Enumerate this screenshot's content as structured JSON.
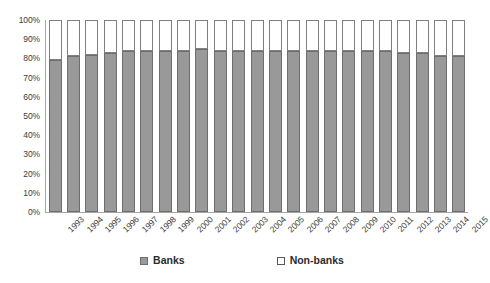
{
  "chart_data": {
    "type": "bar",
    "stacked": true,
    "stacked_mode": "percent",
    "title": "",
    "subtitle": "",
    "xlabel": "",
    "ylabel": "",
    "ylim": [
      0,
      100
    ],
    "ytick_labels": [
      "100%",
      "90%",
      "80%",
      "70%",
      "60%",
      "50%",
      "40%",
      "30%",
      "20%",
      "10%",
      "0%"
    ],
    "ytick_values": [
      100,
      90,
      80,
      70,
      60,
      50,
      40,
      30,
      20,
      10,
      0
    ],
    "grid": false,
    "legend_position": "bottom",
    "categories": [
      "1993",
      "1994",
      "1995",
      "1996",
      "1997",
      "1998",
      "1999",
      "2000",
      "2001",
      "2002",
      "2003",
      "2004",
      "2005",
      "2006",
      "2007",
      "2008",
      "2009",
      "2010",
      "2011",
      "2012",
      "2013",
      "2014",
      "2015"
    ],
    "series": [
      {
        "name": "Banks",
        "color": "#999999",
        "values": [
          79,
          81,
          82,
          83,
          84,
          84,
          84,
          84,
          85,
          84,
          84,
          84,
          84,
          84,
          84,
          84,
          84,
          84,
          84,
          83,
          83,
          81,
          81
        ]
      },
      {
        "name": "Non-banks",
        "color": "#ffffff",
        "values": [
          21,
          19,
          18,
          17,
          16,
          16,
          16,
          16,
          15,
          16,
          16,
          16,
          16,
          16,
          16,
          16,
          16,
          16,
          16,
          17,
          17,
          19,
          19
        ]
      }
    ],
    "legend": [
      {
        "label": "Banks",
        "swatch": "filled-gray-square"
      },
      {
        "label": "Non-banks",
        "swatch": "outlined-white-square"
      }
    ]
  },
  "colors": {
    "banks_fill": "#999999",
    "banks_border": "#6e6e6e",
    "nonbanks_fill": "#ffffff",
    "nonbanks_border": "#808080",
    "axis": "#a6a6a6",
    "text": "#3b3b3b",
    "background": "#ffffff"
  }
}
